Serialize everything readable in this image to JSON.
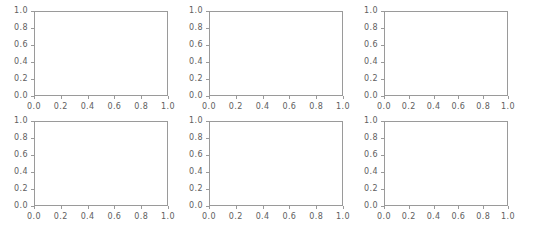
{
  "figure": {
    "background_color": "#ffffff",
    "width": 534,
    "height": 225,
    "spine_color": "#9a9a9a",
    "tick_label_color": "#5e5e5e",
    "rows": 2,
    "cols": 3,
    "subplot_count": 6
  },
  "chart_data": [
    {
      "type": "line",
      "title": "",
      "xlabel": "",
      "ylabel": "",
      "xlim": [
        0.0,
        1.0
      ],
      "ylim": [
        0.0,
        1.0
      ],
      "xticks": [
        "0.0",
        "0.2",
        "0.4",
        "0.6",
        "0.8",
        "1.0"
      ],
      "yticks": [
        "0.0",
        "0.2",
        "0.4",
        "0.6",
        "0.8",
        "1.0"
      ],
      "xtick_values": [
        0.0,
        0.2,
        0.4,
        0.6,
        0.8,
        1.0
      ],
      "ytick_values": [
        0.0,
        0.2,
        0.4,
        0.6,
        0.8,
        1.0
      ],
      "grid": false,
      "legend": null,
      "series": [],
      "annotations": []
    },
    {
      "type": "line",
      "title": "",
      "xlabel": "",
      "ylabel": "",
      "xlim": [
        0.0,
        1.0
      ],
      "ylim": [
        0.0,
        1.0
      ],
      "xticks": [
        "0.0",
        "0.2",
        "0.4",
        "0.6",
        "0.8",
        "1.0"
      ],
      "yticks": [
        "0.0",
        "0.2",
        "0.4",
        "0.6",
        "0.8",
        "1.0"
      ],
      "xtick_values": [
        0.0,
        0.2,
        0.4,
        0.6,
        0.8,
        1.0
      ],
      "ytick_values": [
        0.0,
        0.2,
        0.4,
        0.6,
        0.8,
        1.0
      ],
      "grid": false,
      "legend": null,
      "series": [],
      "annotations": []
    },
    {
      "type": "line",
      "title": "",
      "xlabel": "",
      "ylabel": "",
      "xlim": [
        0.0,
        1.0
      ],
      "ylim": [
        0.0,
        1.0
      ],
      "xticks": [
        "0.0",
        "0.2",
        "0.4",
        "0.6",
        "0.8",
        "1.0"
      ],
      "yticks": [
        "0.0",
        "0.2",
        "0.4",
        "0.6",
        "0.8",
        "1.0"
      ],
      "xtick_values": [
        0.0,
        0.2,
        0.4,
        0.6,
        0.8,
        1.0
      ],
      "ytick_values": [
        0.0,
        0.2,
        0.4,
        0.6,
        0.8,
        1.0
      ],
      "grid": false,
      "legend": null,
      "series": [],
      "annotations": []
    },
    {
      "type": "line",
      "title": "",
      "xlabel": "",
      "ylabel": "",
      "xlim": [
        0.0,
        1.0
      ],
      "ylim": [
        0.0,
        1.0
      ],
      "xticks": [
        "0.0",
        "0.2",
        "0.4",
        "0.6",
        "0.8",
        "1.0"
      ],
      "yticks": [
        "0.0",
        "0.2",
        "0.4",
        "0.6",
        "0.8",
        "1.0"
      ],
      "xtick_values": [
        0.0,
        0.2,
        0.4,
        0.6,
        0.8,
        1.0
      ],
      "ytick_values": [
        0.0,
        0.2,
        0.4,
        0.6,
        0.8,
        1.0
      ],
      "grid": false,
      "legend": null,
      "series": [],
      "annotations": []
    },
    {
      "type": "line",
      "title": "",
      "xlabel": "",
      "ylabel": "",
      "xlim": [
        0.0,
        1.0
      ],
      "ylim": [
        0.0,
        1.0
      ],
      "xticks": [
        "0.0",
        "0.2",
        "0.4",
        "0.6",
        "0.8",
        "1.0"
      ],
      "yticks": [
        "0.0",
        "0.2",
        "0.4",
        "0.6",
        "0.8",
        "1.0"
      ],
      "xtick_values": [
        0.0,
        0.2,
        0.4,
        0.6,
        0.8,
        1.0
      ],
      "ytick_values": [
        0.0,
        0.2,
        0.4,
        0.6,
        0.8,
        1.0
      ],
      "grid": false,
      "legend": null,
      "series": [],
      "annotations": []
    },
    {
      "type": "line",
      "title": "",
      "xlabel": "",
      "ylabel": "",
      "xlim": [
        0.0,
        1.0
      ],
      "ylim": [
        0.0,
        1.0
      ],
      "xticks": [
        "0.0",
        "0.2",
        "0.4",
        "0.6",
        "0.8",
        "1.0"
      ],
      "yticks": [
        "0.0",
        "0.2",
        "0.4",
        "0.6",
        "0.8",
        "1.0"
      ],
      "xtick_values": [
        0.0,
        0.2,
        0.4,
        0.6,
        0.8,
        1.0
      ],
      "ytick_values": [
        0.0,
        0.2,
        0.4,
        0.6,
        0.8,
        1.0
      ],
      "grid": false,
      "legend": null,
      "series": [],
      "annotations": []
    }
  ],
  "layout": {
    "plot_boxes": [
      {
        "left": 34,
        "top": 11,
        "width": 134,
        "height": 85
      },
      {
        "left": 209,
        "top": 11,
        "width": 134,
        "height": 85
      },
      {
        "left": 384,
        "top": 11,
        "width": 124,
        "height": 85
      },
      {
        "left": 34,
        "top": 121,
        "width": 134,
        "height": 85
      },
      {
        "left": 209,
        "top": 121,
        "width": 134,
        "height": 85
      },
      {
        "left": 384,
        "top": 121,
        "width": 124,
        "height": 85
      }
    ]
  }
}
